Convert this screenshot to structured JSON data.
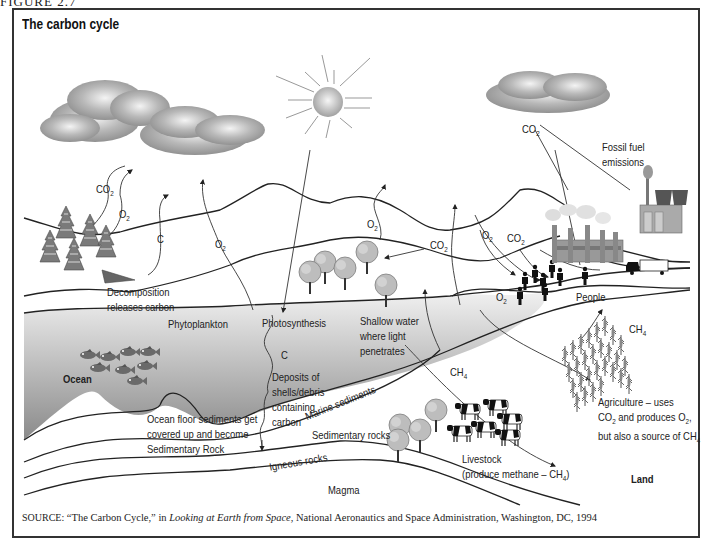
{
  "figure": {
    "caption": "FIGURE 2.7",
    "title": "The carbon cycle"
  },
  "labels": {
    "co2_left": "CO",
    "o2_trees": "O",
    "c_decomp": "C",
    "o2_mid": "O",
    "o2_shallow": "O",
    "co2_trees": "CO",
    "o2_people_upper": "O",
    "co2_people": "CO",
    "o2_people_lower": "O",
    "co2_top": "CO",
    "sub2": "2",
    "sub4": "4",
    "fossil_fuel": [
      "Fossil fuel",
      "emissions"
    ],
    "decomposition": [
      "Decomposition",
      "releases carbon"
    ],
    "phytoplankton": "Phytoplankton",
    "photosynthesis": "Photosynthesis",
    "c_deposit": "C",
    "deposits": [
      "Deposits of",
      "shells/debris",
      "containing",
      "carbon"
    ],
    "shallow_water": [
      "Shallow water",
      "where light",
      "penetrates"
    ],
    "ocean": "Ocean",
    "ocean_floor": [
      "Ocean  floor sediments get",
      "covered up and become",
      "Sedimentary Rock"
    ],
    "marine_sediments": "Marine sediments",
    "sedimentary_rocks": "Sedimentary rocks",
    "igneous_rocks": "Igneous rocks",
    "magma": "Magma",
    "people": "People",
    "ch4_livestock": "CH",
    "ch4_agri": "CH",
    "livestock": [
      "Livestock",
      "(produce methane – CH",
      ")"
    ],
    "agriculture": [
      "Agriculture – uses",
      "CO",
      " and produces O",
      ",",
      "but also a source of CH"
    ],
    "land": "Land"
  },
  "source": {
    "prefix": "SOURCE:",
    "quote": " “The Carbon Cycle,” in ",
    "book": "Looking at Earth from Space",
    "rest": ", National Aeronautics and Space Administration, Washington, DC, 1994"
  },
  "colors": {
    "ocean_top": "#ececec",
    "ocean_bottom": "#8e8e8e",
    "cloud": "#9a9a9a",
    "line": "#222222"
  }
}
